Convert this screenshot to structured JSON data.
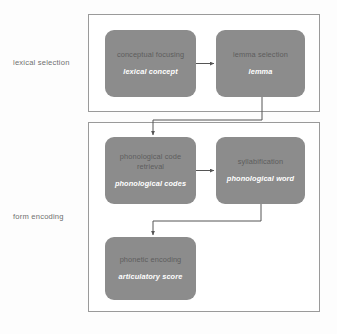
{
  "diagram": {
    "type": "flowchart",
    "colors": {
      "box_fill": "#8c8c8c",
      "box_title_text": "#5d5d5d",
      "box_output_text": "#ffffff",
      "container_border": "#9a9a9a",
      "connector": "#555555",
      "background": "#ffffff",
      "stage_label_text": "#6f6f6f"
    },
    "stages": [
      {
        "id": "lexical-selection",
        "label": "lexical selection",
        "boxes": [
          {
            "id": "conceptual-focusing",
            "title": "conceptual focusing",
            "output": "lexical concept"
          },
          {
            "id": "lemma-selection",
            "title": "lemma selection",
            "output": "lemma"
          }
        ]
      },
      {
        "id": "form-encoding",
        "label": "form encoding",
        "boxes": [
          {
            "id": "phonological-code-retrieval",
            "title": "phonological code retrieval",
            "output": "phonological codes"
          },
          {
            "id": "syllabification",
            "title": "syllabification",
            "output": "phonological word"
          },
          {
            "id": "phonetic-encoding",
            "title": "phonetic encoding",
            "output": "articulatory score"
          }
        ]
      }
    ],
    "connectors": [
      {
        "id": "conceptual-focusing-to-lemma-selection",
        "from": "conceptual-focusing",
        "to": "lemma-selection",
        "shape": "horizontal"
      },
      {
        "id": "lemma-selection-to-phonological-code-retrieval",
        "from": "lemma-selection",
        "to": "phonological-code-retrieval",
        "shape": "elbow"
      },
      {
        "id": "phonological-code-retrieval-to-syllabification",
        "from": "phonological-code-retrieval",
        "to": "syllabification",
        "shape": "horizontal"
      },
      {
        "id": "syllabification-to-phonetic-encoding",
        "from": "syllabification",
        "to": "phonetic-encoding",
        "shape": "elbow"
      }
    ]
  }
}
